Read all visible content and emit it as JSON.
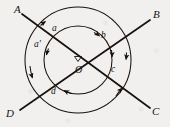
{
  "figure": {
    "type": "geometry-diagram",
    "background_color": "#f2f0ee",
    "stroke_color": "#17120f",
    "center_point": {
      "label": "O",
      "x": 78,
      "y": 60
    },
    "lines": [
      {
        "name": "line-AC",
        "from_label": "A",
        "to_label": "C",
        "from": {
          "x": 22,
          "y": 14
        },
        "to": {
          "x": 150,
          "y": 108
        }
      },
      {
        "name": "line-DB",
        "from_label": "D",
        "to_label": "B",
        "from": {
          "x": 20,
          "y": 110
        },
        "to": {
          "x": 150,
          "y": 20
        }
      }
    ],
    "circles": [
      {
        "name": "outer-circle",
        "cx": 78,
        "cy": 60,
        "r": 53
      },
      {
        "name": "inner-circle",
        "cx": 78,
        "cy": 60,
        "r": 34
      }
    ],
    "endpoint_labels": [
      {
        "id": "A",
        "text": "A",
        "x": 14,
        "y": 4
      },
      {
        "id": "B",
        "text": "B",
        "x": 153,
        "y": 9
      },
      {
        "id": "C",
        "text": "C",
        "x": 152,
        "y": 106
      },
      {
        "id": "D",
        "text": "D",
        "x": 6,
        "y": 108
      }
    ],
    "center_label": {
      "id": "O",
      "text": "O",
      "x": 75,
      "y": 65
    },
    "arc_labels": [
      {
        "id": "a",
        "text": "a",
        "x": 52,
        "y": 24
      },
      {
        "id": "a2",
        "text": "a'",
        "x": 34,
        "y": 40
      },
      {
        "id": "b",
        "text": "b",
        "x": 101,
        "y": 31
      },
      {
        "id": "c",
        "text": "c",
        "x": 111,
        "y": 65
      },
      {
        "id": "d",
        "text": "d",
        "x": 51,
        "y": 87
      }
    ],
    "arrow_marks": [
      {
        "id": "arrow-outer-upper-left",
        "on": "outer-circle"
      },
      {
        "id": "arrow-inner-upper-left",
        "on": "inner-circle"
      },
      {
        "id": "arrow-inner-upper-right",
        "on": "inner-circle"
      },
      {
        "id": "arrow-outer-right",
        "on": "outer-circle"
      },
      {
        "id": "arrow-inner-right",
        "on": "inner-circle"
      },
      {
        "id": "arrow-outer-left",
        "on": "outer-circle"
      },
      {
        "id": "arrow-inner-lower-left",
        "on": "inner-circle"
      },
      {
        "id": "arrow-outer-lower-right",
        "on": "outer-circle"
      }
    ]
  }
}
